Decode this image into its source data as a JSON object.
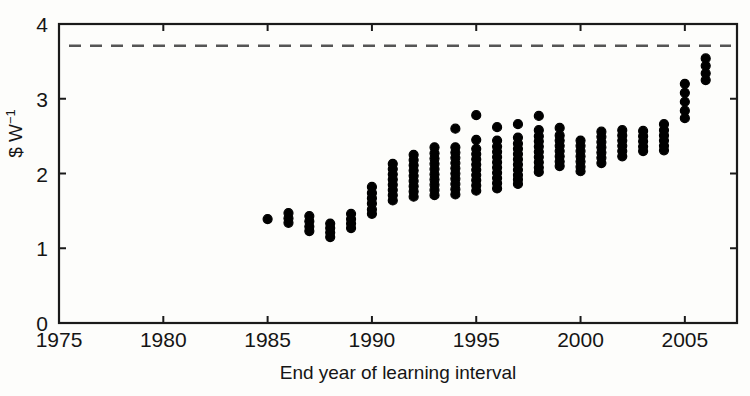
{
  "chart_data": {
    "type": "scatter",
    "title": "",
    "xlabel": "End year of learning interval",
    "ylabel": "$ W−1",
    "ylabel_base": "$ W",
    "ylabel_exponent": "−1",
    "xlim": [
      1975,
      2007.5
    ],
    "ylim": [
      0,
      4
    ],
    "xticks": [
      1975,
      1980,
      1985,
      1990,
      1995,
      2000,
      2005
    ],
    "xtick_labels": [
      "1975",
      "1980",
      "1985",
      "1990",
      "1995",
      "2000",
      "2005"
    ],
    "yticks": [
      0,
      1,
      2,
      3,
      4
    ],
    "ytick_labels": [
      "0",
      "1",
      "2",
      "3",
      "4"
    ],
    "grid": false,
    "legend": null,
    "marker": {
      "shape": "circle",
      "color": "#000000",
      "size": 9
    },
    "reference_line": {
      "kind": "horizontal-dashed",
      "value": 3.71,
      "color": "#555555",
      "dash": "12 9"
    },
    "x": [
      1985,
      1986,
      1987,
      1988,
      1989,
      1990,
      1991,
      1992,
      1993,
      1994,
      1995,
      1996,
      1997,
      1998,
      1999,
      2000,
      2001,
      2002,
      2003,
      2004,
      2005,
      2006
    ],
    "series": [
      {
        "name": "Experience curve price estimates",
        "columns": [
          {
            "year": 1985,
            "values": [
              1.39
            ]
          },
          {
            "year": 1986,
            "values": [
              1.47,
              1.4,
              1.34
            ]
          },
          {
            "year": 1987,
            "values": [
              1.43,
              1.36,
              1.29,
              1.23
            ]
          },
          {
            "year": 1988,
            "values": [
              1.33,
              1.27,
              1.21,
              1.15
            ]
          },
          {
            "year": 1989,
            "values": [
              1.46,
              1.39,
              1.33,
              1.27
            ]
          },
          {
            "year": 1990,
            "values": [
              1.82,
              1.74,
              1.67,
              1.6,
              1.52,
              1.46
            ]
          },
          {
            "year": 1991,
            "values": [
              2.13,
              2.06,
              1.99,
              1.92,
              1.85,
              1.78,
              1.71,
              1.64
            ]
          },
          {
            "year": 1992,
            "values": [
              2.25,
              2.18,
              2.11,
              2.04,
              1.97,
              1.9,
              1.83,
              1.76,
              1.69
            ]
          },
          {
            "year": 1993,
            "values": [
              2.35,
              2.27,
              2.2,
              2.13,
              2.06,
              1.99,
              1.92,
              1.85,
              1.78,
              1.71
            ]
          },
          {
            "year": 1994,
            "values": [
              2.6,
              2.35,
              2.28,
              2.21,
              2.14,
              2.07,
              2.0,
              1.93,
              1.86,
              1.79,
              1.72
            ]
          },
          {
            "year": 1995,
            "values": [
              2.78,
              2.45,
              2.33,
              2.26,
              2.19,
              2.12,
              2.05,
              1.98,
              1.91,
              1.84,
              1.77
            ]
          },
          {
            "year": 1996,
            "values": [
              2.62,
              2.44,
              2.36,
              2.29,
              2.22,
              2.15,
              2.08,
              2.01,
              1.94,
              1.87,
              1.8
            ]
          },
          {
            "year": 1997,
            "values": [
              2.66,
              2.48,
              2.4,
              2.33,
              2.26,
              2.19,
              2.12,
              2.05,
              1.98,
              1.92,
              1.86
            ]
          },
          {
            "year": 1998,
            "values": [
              2.77,
              2.58,
              2.5,
              2.43,
              2.36,
              2.29,
              2.22,
              2.15,
              2.08,
              2.02
            ]
          },
          {
            "year": 1999,
            "values": [
              2.61,
              2.51,
              2.44,
              2.37,
              2.3,
              2.23,
              2.16,
              2.1
            ]
          },
          {
            "year": 2000,
            "values": [
              2.44,
              2.37,
              2.3,
              2.23,
              2.16,
              2.09,
              2.03
            ]
          },
          {
            "year": 2001,
            "values": [
              2.56,
              2.49,
              2.42,
              2.35,
              2.28,
              2.21,
              2.14
            ]
          },
          {
            "year": 2002,
            "values": [
              2.58,
              2.51,
              2.44,
              2.37,
              2.3,
              2.23
            ]
          },
          {
            "year": 2003,
            "values": [
              2.57,
              2.5,
              2.43,
              2.36,
              2.3
            ]
          },
          {
            "year": 2004,
            "values": [
              2.66,
              2.58,
              2.51,
              2.44,
              2.37,
              2.31
            ]
          },
          {
            "year": 2005,
            "values": [
              3.2,
              3.08,
              2.96,
              2.84,
              2.74
            ]
          },
          {
            "year": 2006,
            "values": [
              3.54,
              3.44,
              3.34,
              3.25
            ]
          }
        ]
      }
    ]
  }
}
